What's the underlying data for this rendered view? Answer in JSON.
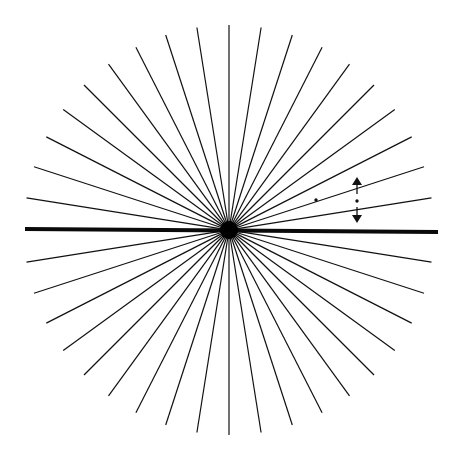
{
  "figure": {
    "type": "radial-line-illusion",
    "background": "#ffffff",
    "line_color": "#111111",
    "center": {
      "x": 229,
      "y": 230
    },
    "radius": 205,
    "ray_count": 40,
    "angle_step_deg": 9,
    "thick_line": {
      "x1": 25,
      "y1": 229,
      "x2": 438,
      "y2": 232,
      "stroke_width": 4
    },
    "center_blob_radius": 9,
    "dots": [
      {
        "x": 316,
        "y": 200,
        "r": 1.7
      },
      {
        "x": 357,
        "y": 201,
        "r": 1.7
      }
    ],
    "arrows": [
      {
        "direction": "up",
        "x": 357,
        "tip_y": 177,
        "base_y": 194
      },
      {
        "direction": "down",
        "x": 357,
        "tip_y": 223,
        "base_y": 207
      }
    ]
  }
}
